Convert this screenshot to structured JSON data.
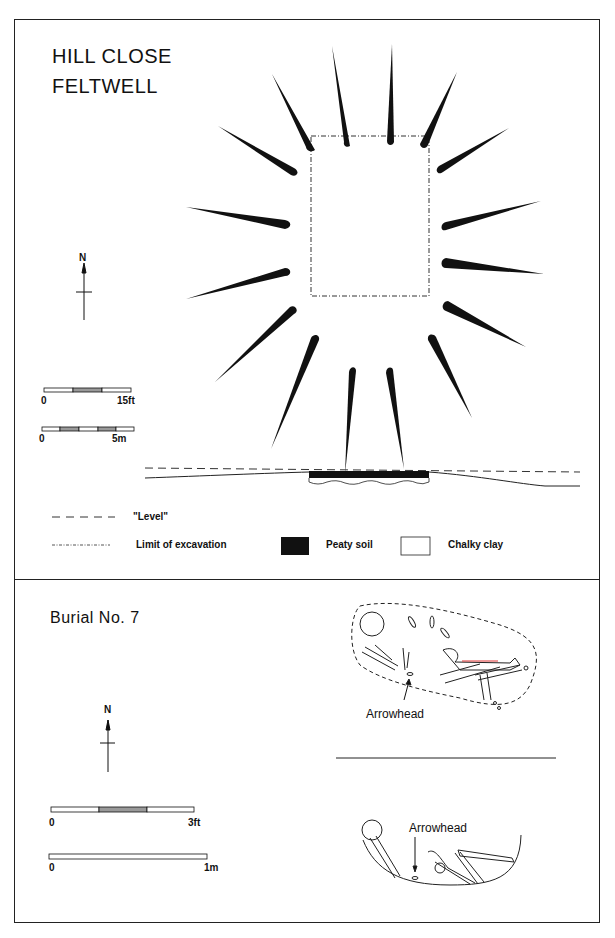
{
  "top_panel": {
    "title_line1": "HILL CLOSE",
    "title_line2": "FELTWELL",
    "north_label": "N",
    "scale_ft": {
      "start": "0",
      "end": "15ft"
    },
    "scale_m": {
      "start": "0",
      "end": "5m"
    },
    "legend": {
      "level": "\"Level\"",
      "limit": "Limit of excavation",
      "peaty": "Peaty soil",
      "chalky": "Chalky clay"
    },
    "colors": {
      "ink": "#111111",
      "peaty_fill": "#111111",
      "scale_fill": "#999999"
    }
  },
  "bottom_panel": {
    "title": "Burial No. 7",
    "north_label": "N",
    "scale_ft": {
      "start": "0",
      "end": "3ft"
    },
    "scale_m": {
      "start": "0",
      "end": "1m"
    },
    "plan_label": "Arrowhead",
    "section_label": "Arrowhead"
  }
}
